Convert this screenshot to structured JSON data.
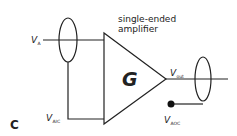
{
  "panel_label": "C",
  "title": {
    "line1": "single-ended",
    "line2": "amplifier"
  },
  "gain_symbol": "G",
  "nodes": {
    "input": {
      "v": "V",
      "sub": "A"
    },
    "input_common": {
      "v": "V",
      "sub": "AIC"
    },
    "output": {
      "v": "V",
      "sub": "out"
    },
    "output_common": {
      "v": "V",
      "sub": "AOC"
    }
  },
  "colors": {
    "stroke": "#222222",
    "background": "#ffffff"
  }
}
